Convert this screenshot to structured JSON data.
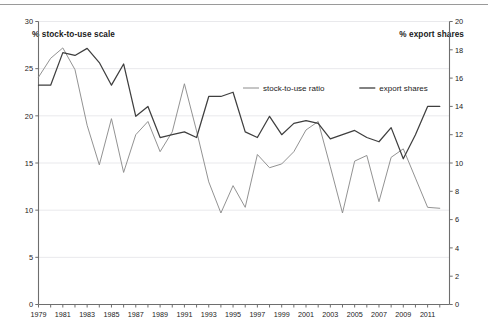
{
  "figure": {
    "left_axis_title": "% stock-to-use scale",
    "right_axis_title": "% export shares",
    "background_color": "#ffffff",
    "top_rule_color": "#9a9a9a"
  },
  "chart_data": {
    "type": "line",
    "title": "",
    "subtitle": "",
    "xlabel": "",
    "ylabel": "% stock-to-use scale",
    "y2label": "% export shares",
    "grid": true,
    "grid_axis": "y",
    "legend_position": "top-center",
    "x": [
      1979,
      1980,
      1981,
      1982,
      1983,
      1984,
      1985,
      1986,
      1987,
      1988,
      1989,
      1990,
      1991,
      1992,
      1993,
      1994,
      1995,
      1996,
      1997,
      1998,
      1999,
      2000,
      2001,
      2002,
      2003,
      2004,
      2005,
      2006,
      2007,
      2008,
      2009,
      2010,
      2011,
      2012
    ],
    "xtick_labels": [
      "1979",
      "1981",
      "1983",
      "1985",
      "1987",
      "1989",
      "1991",
      "1993",
      "1995",
      "1997",
      "1999",
      "2001",
      "2003",
      "2005",
      "2007",
      "2009",
      "2011"
    ],
    "xtick_values": [
      1979,
      1981,
      1983,
      1985,
      1987,
      1989,
      1991,
      1993,
      1995,
      1997,
      1999,
      2001,
      2003,
      2005,
      2007,
      2009,
      2011
    ],
    "xlim": [
      1979,
      2012.8
    ],
    "ylim": [
      0,
      30
    ],
    "ytick_values": [
      0,
      5,
      10,
      15,
      20,
      25,
      30
    ],
    "ytick_labels": [
      "0",
      "5",
      "10",
      "15",
      "20",
      "25",
      "30"
    ],
    "y2lim": [
      0,
      20
    ],
    "y2tick_values": [
      0,
      2,
      4,
      6,
      8,
      10,
      12,
      14,
      16,
      18,
      20
    ],
    "y2tick_labels": [
      "0",
      "2",
      "4",
      "6",
      "8",
      "10",
      "12",
      "14",
      "16",
      "18",
      "20"
    ],
    "series": [
      {
        "name": "stock-to-use ratio",
        "axis": "left",
        "color": "#8c8c8c",
        "values": [
          24.1,
          26.1,
          27.2,
          24.9,
          19.0,
          14.8,
          19.7,
          14.0,
          18.0,
          19.4,
          16.2,
          18.3,
          23.4,
          18.4,
          13.0,
          9.7,
          12.6,
          10.3,
          15.9,
          14.5,
          14.9,
          16.2,
          18.5,
          19.4,
          14.6,
          9.7,
          15.2,
          15.8,
          10.9,
          15.6,
          16.5,
          13.4,
          10.3,
          10.2
        ]
      },
      {
        "name": "export shares",
        "axis": "right",
        "color": "#3f3f3f",
        "values": [
          15.5,
          15.5,
          17.8,
          17.6,
          18.1,
          17.1,
          15.5,
          17.0,
          13.3,
          14.0,
          11.8,
          12.0,
          12.2,
          11.8,
          14.7,
          14.7,
          15.0,
          12.2,
          11.8,
          13.3,
          12.0,
          12.8,
          13.0,
          12.8,
          11.7,
          12.0,
          12.3,
          11.8,
          11.5,
          12.5,
          10.3,
          12.0,
          14.0,
          14.0
        ]
      }
    ],
    "legend_entries": [
      {
        "label": "stock-to-use ratio",
        "color": "#8c8c8c"
      },
      {
        "label": "export shares",
        "color": "#3f3f3f"
      }
    ]
  }
}
